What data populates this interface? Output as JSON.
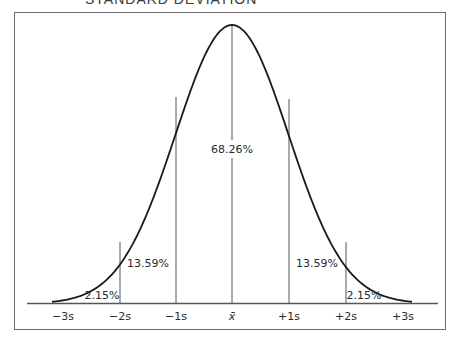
{
  "chart_data": {
    "type": "area",
    "title": "STANDARD DEVIATION",
    "xlabel": "",
    "ylabel": "",
    "grid": false,
    "legend": null,
    "x": [
      "-3s",
      "-2s",
      "-1s",
      "x̄",
      "+1s",
      "+2s",
      "+3s"
    ],
    "tick_labels": [
      "−3s",
      "−2s",
      "−1s",
      "x̄",
      "+1s",
      "+2s",
      "+3s"
    ],
    "regions": [
      {
        "range": [
          "-3s",
          "-2s"
        ],
        "label": "2.15%",
        "value": 2.15
      },
      {
        "range": [
          "-2s",
          "-1s"
        ],
        "label": "13.59%",
        "value": 13.59
      },
      {
        "range": [
          "-1s",
          "+1s"
        ],
        "label": "68.26%",
        "value": 68.26
      },
      {
        "range": [
          "+1s",
          "+2s"
        ],
        "label": "13.59%",
        "value": 13.59
      },
      {
        "range": [
          "+2s",
          "+3s"
        ],
        "label": "2.15%",
        "value": 2.15
      }
    ],
    "curve": "normal distribution (bell curve)",
    "divider_lines_at": [
      "-2s",
      "-1s",
      "x̄",
      "+1s",
      "+2s"
    ]
  },
  "labels": {
    "title": "STANDARD DEVIATION",
    "center": "68.26%",
    "left_mid": "13.59%",
    "right_mid": "13.59%",
    "left_tail": "2.15%",
    "right_tail": "2.15%",
    "ticks": [
      "−3s",
      "−2s",
      "−1s",
      "x̄",
      "+1s",
      "+2s",
      "+3s"
    ]
  }
}
